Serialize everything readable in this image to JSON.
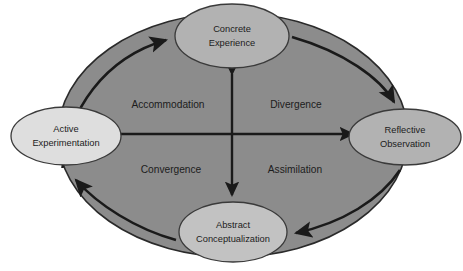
{
  "diagram": {
    "type": "cycle-quadrant-diagram",
    "colors": {
      "page_background": "#ffffff",
      "outer_ellipse_fill": "#8c8c8c",
      "outer_ellipse_stroke": "#2a2a2a",
      "node_stroke": "#3a3a3a",
      "arrow_color": "#1a1a1a",
      "text_color": "#1c1c1c",
      "node_fill_top": "#b2b2b2",
      "node_fill_right": "#b2b2b2",
      "node_fill_bottom": "#c2c2c2",
      "node_fill_left": "#dedede"
    },
    "nodes": [
      {
        "id": "concrete-experience",
        "position": "top",
        "line1": "Concrete",
        "line2": "Experience",
        "cx": 232,
        "cy": 36,
        "rx": 57,
        "ry": 32,
        "fill": "#b2b2b2"
      },
      {
        "id": "reflective-observation",
        "position": "right",
        "line1": "Reflective",
        "line2": "Observation",
        "cx": 405,
        "cy": 137,
        "rx": 56,
        "ry": 28,
        "fill": "#b2b2b2"
      },
      {
        "id": "abstract-conceptualization",
        "position": "bottom",
        "line1": "Abstract",
        "line2": "Conceptualization",
        "cx": 233,
        "cy": 232,
        "rx": 54,
        "ry": 30,
        "fill": "#c2c2c2"
      },
      {
        "id": "active-experimentation",
        "position": "left",
        "line1": "Active",
        "line2": "Experimentation",
        "cx": 66,
        "cy": 136,
        "rx": 55,
        "ry": 29,
        "fill": "#dedede"
      }
    ],
    "quadrant_labels": [
      {
        "id": "accommodation",
        "text": "Accommodation",
        "x": 168,
        "y": 105,
        "quadrant": "top-left"
      },
      {
        "id": "divergence",
        "text": "Divergence",
        "x": 295,
        "y": 105,
        "quadrant": "top-right"
      },
      {
        "id": "convergence",
        "text": "Convergence",
        "x": 171,
        "y": 170,
        "quadrant": "bottom-left"
      },
      {
        "id": "assimilation",
        "text": "Assimilation",
        "x": 295,
        "y": 170,
        "quadrant": "bottom-right"
      }
    ],
    "cycle_arrows": [
      {
        "id": "arrow-to-concrete-experience",
        "from": "active-experimentation",
        "to": "concrete-experience",
        "direction": "clockwise"
      },
      {
        "id": "arrow-to-reflective-observation",
        "from": "concrete-experience",
        "to": "reflective-observation",
        "direction": "clockwise"
      },
      {
        "id": "arrow-to-abstract-conceptualization",
        "from": "reflective-observation",
        "to": "abstract-conceptualization",
        "direction": "clockwise"
      },
      {
        "id": "arrow-to-active-experimentation",
        "from": "abstract-conceptualization",
        "to": "active-experimentation",
        "direction": "clockwise"
      }
    ],
    "axis_arrows": [
      {
        "id": "vertical-axis",
        "orientation": "vertical",
        "double_headed": true,
        "x": 232,
        "y1": 70,
        "y2": 198
      },
      {
        "id": "horizontal-axis",
        "orientation": "horizontal",
        "double_headed": true,
        "y": 134,
        "x1": 110,
        "x2": 357
      }
    ],
    "outer_ellipse": {
      "cx": 233,
      "cy": 135,
      "rx": 175,
      "ry": 122
    }
  }
}
